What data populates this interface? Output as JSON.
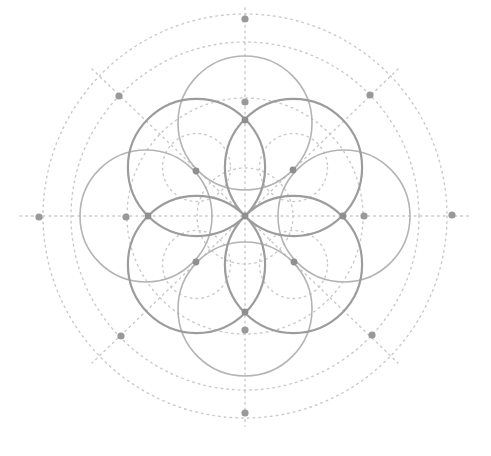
{
  "diagram": {
    "center": {
      "x": 245,
      "y": 216
    },
    "colors": {
      "background": "#ffffff",
      "solid_light": "#b4b4b4",
      "solid_dark": "#9c9c9c",
      "dotted": "#c9c9c9",
      "marker": "#999999"
    },
    "dark_circles": [
      {
        "cx": 196.5,
        "cy": 167.5,
        "r": 68.6
      },
      {
        "cx": 293.5,
        "cy": 167.5,
        "r": 68.6
      },
      {
        "cx": 196.5,
        "cy": 264.5,
        "r": 68.6
      },
      {
        "cx": 293.5,
        "cy": 264.5,
        "r": 68.6
      }
    ],
    "light_circles": [
      {
        "cx": 245,
        "cy": 123,
        "r": 67
      },
      {
        "cx": 245,
        "cy": 309,
        "r": 67
      },
      {
        "cx": 146,
        "cy": 216,
        "r": 66
      },
      {
        "cx": 344,
        "cy": 216,
        "r": 66
      }
    ],
    "dotted_circles": [
      {
        "cx": 245,
        "cy": 216,
        "r": 48
      },
      {
        "cx": 245,
        "cy": 216,
        "r": 118
      },
      {
        "cx": 245,
        "cy": 216,
        "r": 174
      },
      {
        "cx": 245,
        "cy": 216,
        "r": 202
      }
    ],
    "dotted_lines": [
      {
        "x1": 20,
        "y1": 216,
        "x2": 471,
        "y2": 216
      },
      {
        "x1": 245,
        "y1": 8,
        "x2": 245,
        "y2": 426
      },
      {
        "x1": 92,
        "y1": 69,
        "x2": 398,
        "y2": 363
      },
      {
        "x1": 398,
        "y1": 69,
        "x2": 92,
        "y2": 363
      }
    ],
    "markers": [
      {
        "x": 245,
        "y": 19,
        "label": "outer-top"
      },
      {
        "x": 245,
        "y": 413,
        "label": "outer-bottom"
      },
      {
        "x": 39,
        "y": 217,
        "label": "outer-left"
      },
      {
        "x": 452,
        "y": 215,
        "label": "outer-right"
      },
      {
        "x": 119,
        "y": 96,
        "label": "diag-top-left"
      },
      {
        "x": 370,
        "y": 95,
        "label": "diag-top-right"
      },
      {
        "x": 121,
        "y": 336,
        "label": "diag-bottom-left"
      },
      {
        "x": 372,
        "y": 335,
        "label": "diag-bottom-right"
      },
      {
        "x": 245,
        "y": 102,
        "label": "inner-top"
      },
      {
        "x": 245,
        "y": 330,
        "label": "inner-bottom"
      },
      {
        "x": 126,
        "y": 217,
        "label": "inner-left"
      },
      {
        "x": 364,
        "y": 216,
        "label": "inner-right"
      }
    ],
    "nodes": [
      {
        "x": 245,
        "y": 216,
        "label": "center"
      },
      {
        "x": 245,
        "y": 120,
        "label": "petal-top"
      },
      {
        "x": 245,
        "y": 312,
        "label": "petal-bottom"
      },
      {
        "x": 148,
        "y": 216,
        "label": "petal-left"
      },
      {
        "x": 343,
        "y": 216,
        "label": "petal-right"
      },
      {
        "x": 196,
        "y": 171,
        "label": "intersection-top-left"
      },
      {
        "x": 293,
        "y": 170,
        "label": "intersection-top-right"
      },
      {
        "x": 196,
        "y": 262,
        "label": "intersection-bottom-left"
      },
      {
        "x": 294,
        "y": 262,
        "label": "intersection-bottom-right"
      }
    ]
  }
}
